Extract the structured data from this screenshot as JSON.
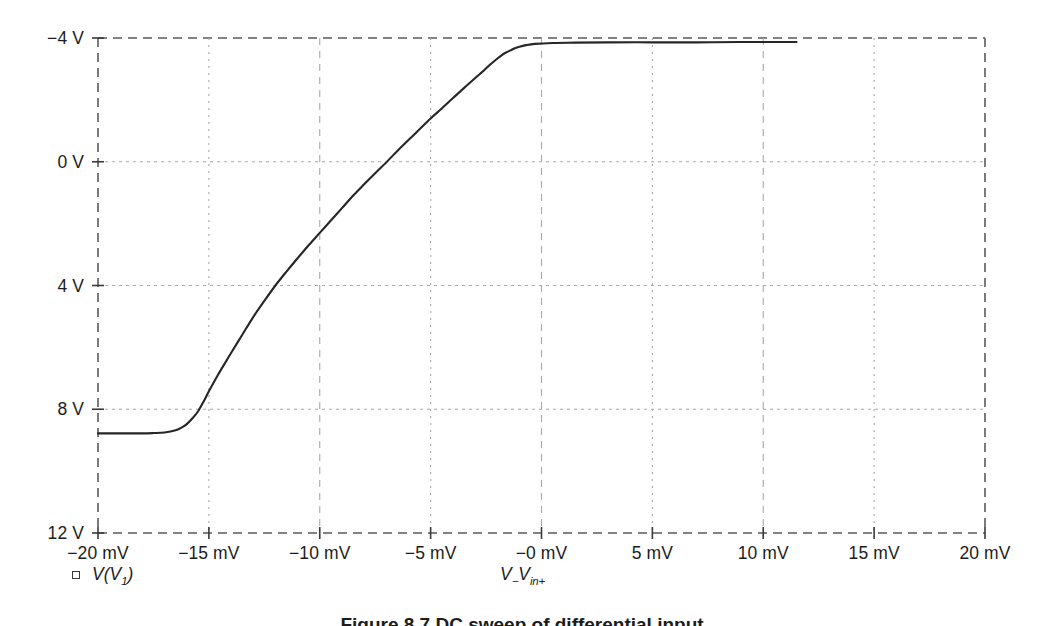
{
  "figure": {
    "caption": "Figure 8.7  DC sweep of differential input",
    "top_cropped_text": "",
    "background_color": "#ffffff",
    "curve_color": "#262626",
    "grid_color": "#a8a8a8"
  },
  "legend": {
    "marker": "open-square",
    "series_name_main": "V(V",
    "series_name_sub": "1",
    "series_name_tail": ")"
  },
  "axes": {
    "x_title_main": "V",
    "x_title_sub1": "−",
    "x_title_main2": "V",
    "x_title_sub2": "in+",
    "y_tick_labels": [
      "12 V",
      "8 V",
      "4 V",
      "0 V",
      "−4 V"
    ],
    "x_tick_labels": [
      "−20 mV",
      "−15 mV",
      "−10 mV",
      "−5 mV",
      "−0 mV",
      "5 mV",
      "10 mV",
      "15 mV",
      "20 mV"
    ]
  },
  "chart_data": {
    "type": "line",
    "title": "",
    "xlabel": "V- Vin+",
    "ylabel": "V",
    "xlim": [
      -20,
      20
    ],
    "ylim": [
      -4,
      12
    ],
    "xunit": "mV",
    "yunit": "V",
    "xticks": [
      -20,
      -15,
      -10,
      -5,
      0,
      5,
      10,
      15,
      20
    ],
    "yticks": [
      -4,
      0,
      4,
      8,
      12
    ],
    "grid": true,
    "legend_position": "below-left",
    "series": [
      {
        "name": "V(V1)",
        "marker": "open-square",
        "color": "#262626",
        "x": [
          -20.0,
          -19.0,
          -18.0,
          -17.5,
          -17.0,
          -16.5,
          -16.2,
          -16.0,
          -15.8,
          -15.5,
          -15.2,
          -15.0,
          -14.6,
          -14.2,
          -14.0,
          -13.5,
          -13.0,
          -12.5,
          -12.0,
          -11.5,
          -11.0,
          -10.5,
          -10.0,
          -9.5,
          -9.0,
          -8.5,
          -8.0,
          -7.5,
          -7.0,
          -6.5,
          -6.0,
          -5.5,
          -5.0,
          -4.5,
          -4.0,
          -3.5,
          -3.0,
          -2.6,
          -2.3,
          -2.0,
          -1.8,
          -1.6,
          -1.4,
          -1.2,
          -1.0,
          -0.7,
          -0.3,
          0.5,
          1.5,
          3.0,
          5.0,
          7.0,
          9.0,
          10.5,
          11.5
        ],
        "y": [
          -0.78,
          -0.78,
          -0.78,
          -0.77,
          -0.75,
          -0.68,
          -0.58,
          -0.48,
          -0.34,
          -0.08,
          0.3,
          0.58,
          1.1,
          1.58,
          1.82,
          2.4,
          2.98,
          3.5,
          4.0,
          4.45,
          4.88,
          5.3,
          5.7,
          6.1,
          6.5,
          6.9,
          7.27,
          7.63,
          7.98,
          8.35,
          8.7,
          9.05,
          9.4,
          9.72,
          10.05,
          10.38,
          10.7,
          10.95,
          11.15,
          11.33,
          11.44,
          11.53,
          11.6,
          11.67,
          11.72,
          11.77,
          11.81,
          11.84,
          11.85,
          11.86,
          11.86,
          11.86,
          11.87,
          11.87,
          11.87
        ]
      }
    ]
  },
  "geometry": {
    "plot_left": 98,
    "plot_right": 985,
    "plot_top": 38,
    "plot_bottom": 533
  }
}
